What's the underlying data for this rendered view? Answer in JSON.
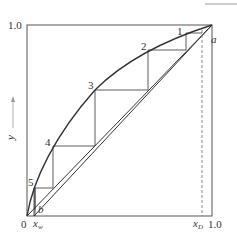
{
  "figure": {
    "type": "McCabe-Thiele stepwise construction",
    "y_axis": {
      "label": "y",
      "arrow": "→",
      "tick_top": "1.0"
    },
    "x_axis": {
      "tick_origin": "0",
      "tick_right": "1.0",
      "xw_label": "x",
      "xw_sub": "w",
      "xd_label": "x",
      "xd_sub": "D"
    },
    "points": {
      "a": "a",
      "b": "b"
    },
    "stages": [
      "1",
      "2",
      "3",
      "4",
      "5"
    ]
  },
  "colors": {
    "line": "#333333",
    "frame": "#555555",
    "dashed": "#888888",
    "topbar": "#cccccc"
  }
}
